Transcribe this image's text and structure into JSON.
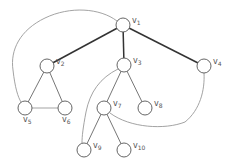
{
  "diagram": {
    "type": "graph",
    "colors": {
      "tree_edge_bold": "#333333",
      "tree_edge": "#666666",
      "back_edge": "#999999",
      "node_stroke": "#555555",
      "node_fill": "#ffffff",
      "label": "#555555"
    },
    "nodes": [
      {
        "id": "v1",
        "base": "v",
        "sub": "1",
        "x": 123,
        "y": 25
      },
      {
        "id": "v2",
        "base": "v",
        "sub": "2",
        "x": 47,
        "y": 66
      },
      {
        "id": "v3",
        "base": "v",
        "sub": "3",
        "x": 124,
        "y": 65
      },
      {
        "id": "v4",
        "base": "v",
        "sub": "4",
        "x": 204,
        "y": 66
      },
      {
        "id": "v5",
        "base": "v",
        "sub": "5",
        "x": 25,
        "y": 108
      },
      {
        "id": "v6",
        "base": "v",
        "sub": "6",
        "x": 65,
        "y": 108
      },
      {
        "id": "v7",
        "base": "v",
        "sub": "7",
        "x": 104,
        "y": 108
      },
      {
        "id": "v8",
        "base": "v",
        "sub": "8",
        "x": 145,
        "y": 108
      },
      {
        "id": "v9",
        "base": "v",
        "sub": "9",
        "x": 84,
        "y": 150
      },
      {
        "id": "v10",
        "base": "v",
        "sub": "10",
        "x": 124,
        "y": 150
      }
    ],
    "edges": [
      {
        "from": "v1",
        "to": "v2",
        "style": "bold"
      },
      {
        "from": "v1",
        "to": "v3",
        "style": "bold"
      },
      {
        "from": "v1",
        "to": "v4",
        "style": "bold"
      },
      {
        "from": "v2",
        "to": "v5",
        "style": "normal"
      },
      {
        "from": "v2",
        "to": "v6",
        "style": "normal"
      },
      {
        "from": "v5",
        "to": "v6",
        "style": "light"
      },
      {
        "from": "v3",
        "to": "v7",
        "style": "normal"
      },
      {
        "from": "v3",
        "to": "v8",
        "style": "normal"
      },
      {
        "from": "v7",
        "to": "v9",
        "style": "normal"
      },
      {
        "from": "v7",
        "to": "v10",
        "style": "normal"
      },
      {
        "from": "v1",
        "to": "v5",
        "style": "curve"
      },
      {
        "from": "v3",
        "to": "v9",
        "style": "curve"
      },
      {
        "from": "v4",
        "to": "v7",
        "style": "curve"
      }
    ]
  }
}
